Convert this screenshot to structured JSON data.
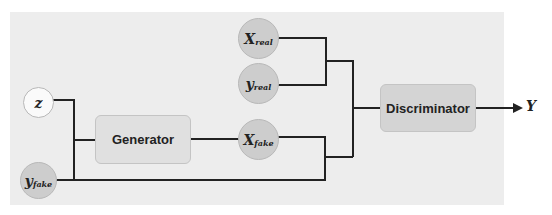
{
  "diagram": {
    "title": "",
    "nodes": {
      "z": {
        "label": "z"
      },
      "y_fake": {
        "label": "y",
        "sub": "fake"
      },
      "x_real": {
        "label": "X",
        "sub": "real"
      },
      "y_real": {
        "label": "y",
        "sub": "real"
      },
      "x_fake": {
        "label": "X",
        "sub": "fake"
      }
    },
    "blocks": {
      "generator": "Generator",
      "discriminator": "Discriminator"
    },
    "output": "Y",
    "edges": [
      [
        "z",
        "generator"
      ],
      [
        "y_fake",
        "generator"
      ],
      [
        "generator",
        "x_fake"
      ],
      [
        "x_real",
        "discriminator"
      ],
      [
        "y_real",
        "discriminator"
      ],
      [
        "x_fake",
        "discriminator"
      ],
      [
        "y_fake",
        "discriminator"
      ],
      [
        "discriminator",
        "Y"
      ]
    ],
    "colors": {
      "node_fill": "#cdcdcd",
      "block_fill": "#d4d4d4",
      "line": "#222222",
      "panel": "#ededed"
    }
  }
}
